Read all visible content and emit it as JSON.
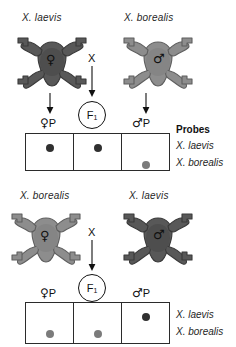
{
  "figure": {
    "colors": {
      "frog_laevis": "#585858",
      "frog_borealis": "#8d8d8d",
      "band_dark": "#303030",
      "band_light": "#7b7b7b",
      "line": "#2b2b2b"
    }
  },
  "panels": [
    {
      "id": "top",
      "parents": [
        {
          "species": "X. laevis",
          "sex_symbol": "♀",
          "sex": "female",
          "shade": "dark"
        },
        {
          "species": "X. borealis",
          "sex_symbol": "♂",
          "sex": "male",
          "shade": "light"
        }
      ],
      "cross_symbol": "X",
      "f1_label": "F",
      "f1_subscript": "1",
      "lane_labels": [
        {
          "symbol": "♀",
          "text": "P"
        },
        {
          "symbol": "",
          "text": ""
        },
        {
          "symbol": "♂",
          "text": "P"
        }
      ],
      "probes_header": "Probes",
      "probe_rows": [
        {
          "label": "X. laevis",
          "bands": [
            "dark",
            "dark",
            "none"
          ]
        },
        {
          "label": "X. borealis",
          "bands": [
            "none",
            "none",
            "light"
          ]
        }
      ]
    },
    {
      "id": "bottom",
      "parents": [
        {
          "species": "X. borealis",
          "sex_symbol": "♀",
          "sex": "female",
          "shade": "light"
        },
        {
          "species": "X. laevis",
          "sex_symbol": "♂",
          "sex": "male",
          "shade": "dark"
        }
      ],
      "cross_symbol": "X",
      "f1_label": "F",
      "f1_subscript": "1",
      "lane_labels": [
        {
          "symbol": "♀",
          "text": "P"
        },
        {
          "symbol": "",
          "text": ""
        },
        {
          "symbol": "♂",
          "text": "P"
        }
      ],
      "probes_header": "",
      "probe_rows": [
        {
          "label": "X. laevis",
          "bands": [
            "none",
            "none",
            "dark"
          ]
        },
        {
          "label": "X. borealis",
          "bands": [
            "light",
            "light",
            "none"
          ]
        }
      ]
    }
  ]
}
